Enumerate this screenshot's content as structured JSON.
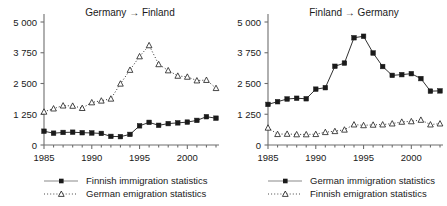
{
  "figure": {
    "background": "#ffffff",
    "axis_color": "#6e6e6e",
    "series_color": "#1a1a1a",
    "width": 447,
    "height": 206
  },
  "panels": [
    {
      "id": "germany-to-finland",
      "title": "Germany → Finland",
      "legend": [
        {
          "label": "Finnish immigration statistics",
          "marker": "filled-square",
          "line": "solid"
        },
        {
          "label": "German emigration statistics",
          "marker": "open-triangle",
          "line": "dotted"
        }
      ]
    },
    {
      "id": "finland-to-germany",
      "title": "Finland → Germany",
      "legend": [
        {
          "label": "German immigration statistics",
          "marker": "filled-square",
          "line": "solid"
        },
        {
          "label": "Finnish emigration statistics",
          "marker": "open-triangle",
          "line": "dotted"
        }
      ]
    }
  ],
  "chart_data": [
    {
      "type": "line",
      "title": "Germany → Finland",
      "xlabel": "",
      "ylabel": "",
      "xlim": [
        1985,
        2003
      ],
      "ylim": [
        0,
        5000
      ],
      "xticks": [
        1985,
        1990,
        1995,
        2000
      ],
      "xticklabels": [
        "1985",
        "1990",
        "1995",
        "2000"
      ],
      "yticks": [
        0,
        1250,
        2500,
        3750,
        5000
      ],
      "yticklabels": [
        "0",
        "1 250",
        "2 500",
        "3 750",
        "5 000"
      ],
      "grid": false,
      "legend_position": "below",
      "x": [
        1985,
        1986,
        1987,
        1988,
        1989,
        1990,
        1991,
        1992,
        1993,
        1994,
        1995,
        1996,
        1997,
        1998,
        1999,
        2000,
        2001,
        2002,
        2003
      ],
      "series": [
        {
          "name": "Finnish immigration statistics",
          "marker": "filled-square",
          "line": "solid",
          "values": [
            560,
            480,
            510,
            520,
            500,
            490,
            470,
            350,
            340,
            430,
            780,
            920,
            800,
            870,
            900,
            930,
            1000,
            1150,
            1090
          ]
        },
        {
          "name": "German emigration statistics",
          "marker": "open-triangle",
          "line": "dotted",
          "values": [
            1350,
            1480,
            1600,
            1590,
            1500,
            1730,
            1800,
            1880,
            2490,
            3050,
            3600,
            4050,
            3280,
            3030,
            2810,
            2770,
            2620,
            2640,
            2310
          ]
        }
      ]
    },
    {
      "type": "line",
      "title": "Finland → Germany",
      "xlabel": "",
      "ylabel": "",
      "xlim": [
        1985,
        2003
      ],
      "ylim": [
        0,
        5000
      ],
      "xticks": [
        1985,
        1990,
        1995,
        2000
      ],
      "xticklabels": [
        "1985",
        "1990",
        "1995",
        "2000"
      ],
      "yticks": [
        0,
        1250,
        2500,
        3750,
        5000
      ],
      "yticklabels": [
        "0",
        "1 250",
        "2 500",
        "3 750",
        "5 000"
      ],
      "grid": false,
      "legend_position": "below",
      "x": [
        1985,
        1986,
        1987,
        1988,
        1989,
        1990,
        1991,
        1992,
        1993,
        1994,
        1995,
        1996,
        1997,
        1998,
        1999,
        2000,
        2001,
        2002,
        2003
      ],
      "series": [
        {
          "name": "German immigration statistics",
          "marker": "filled-square",
          "line": "solid",
          "values": [
            1650,
            1760,
            1870,
            1900,
            1880,
            2270,
            2330,
            3200,
            3330,
            4360,
            4420,
            3740,
            3190,
            2830,
            2860,
            2900,
            2700,
            2190,
            2200
          ]
        },
        {
          "name": "Finnish emigration statistics",
          "marker": "open-triangle",
          "line": "dotted",
          "values": [
            700,
            440,
            450,
            430,
            430,
            440,
            520,
            560,
            620,
            830,
            800,
            820,
            830,
            870,
            940,
            960,
            1020,
            830,
            870
          ]
        }
      ]
    }
  ]
}
